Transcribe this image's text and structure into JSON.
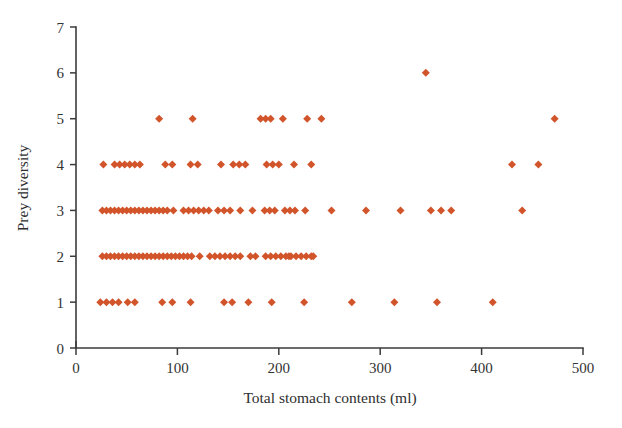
{
  "chart_data": {
    "type": "scatter",
    "title": "",
    "xlabel": "Total stomach contents (ml)",
    "ylabel": "Prey diversity",
    "xlim": [
      0,
      500
    ],
    "ylim": [
      0,
      7
    ],
    "grid": false,
    "legend": null,
    "marker": {
      "shape": "diamond",
      "color": "#D2542A",
      "size_px": 8
    },
    "xticks": [
      0,
      100,
      200,
      300,
      400,
      500
    ],
    "xtick_labels": [
      "0",
      "100",
      "200",
      "300",
      "400",
      "500"
    ],
    "yticks": [
      0,
      1,
      2,
      3,
      4,
      5,
      6,
      7
    ],
    "ytick_labels": [
      "0",
      "1",
      "2",
      "3",
      "4",
      "5",
      "6",
      "7"
    ],
    "axis_color": "#3b3b3b",
    "background": "#ffffff",
    "points": [
      {
        "x": 24,
        "y": 1
      },
      {
        "x": 30,
        "y": 1
      },
      {
        "x": 36,
        "y": 1
      },
      {
        "x": 42,
        "y": 1
      },
      {
        "x": 51,
        "y": 1
      },
      {
        "x": 58,
        "y": 1
      },
      {
        "x": 85,
        "y": 1
      },
      {
        "x": 95,
        "y": 1
      },
      {
        "x": 113,
        "y": 1
      },
      {
        "x": 146,
        "y": 1
      },
      {
        "x": 154,
        "y": 1
      },
      {
        "x": 170,
        "y": 1
      },
      {
        "x": 193,
        "y": 1
      },
      {
        "x": 225,
        "y": 1
      },
      {
        "x": 272,
        "y": 1
      },
      {
        "x": 314,
        "y": 1
      },
      {
        "x": 356,
        "y": 1
      },
      {
        "x": 411,
        "y": 1
      },
      {
        "x": 26,
        "y": 2
      },
      {
        "x": 30,
        "y": 2
      },
      {
        "x": 34,
        "y": 2
      },
      {
        "x": 38,
        "y": 2
      },
      {
        "x": 42,
        "y": 2
      },
      {
        "x": 46,
        "y": 2
      },
      {
        "x": 50,
        "y": 2
      },
      {
        "x": 54,
        "y": 2
      },
      {
        "x": 58,
        "y": 2
      },
      {
        "x": 62,
        "y": 2
      },
      {
        "x": 66,
        "y": 2
      },
      {
        "x": 70,
        "y": 2
      },
      {
        "x": 74,
        "y": 2
      },
      {
        "x": 78,
        "y": 2
      },
      {
        "x": 82,
        "y": 2
      },
      {
        "x": 86,
        "y": 2
      },
      {
        "x": 90,
        "y": 2
      },
      {
        "x": 94,
        "y": 2
      },
      {
        "x": 98,
        "y": 2
      },
      {
        "x": 102,
        "y": 2
      },
      {
        "x": 106,
        "y": 2
      },
      {
        "x": 110,
        "y": 2
      },
      {
        "x": 114,
        "y": 2
      },
      {
        "x": 122,
        "y": 2
      },
      {
        "x": 132,
        "y": 2
      },
      {
        "x": 137,
        "y": 2
      },
      {
        "x": 142,
        "y": 2
      },
      {
        "x": 147,
        "y": 2
      },
      {
        "x": 152,
        "y": 2
      },
      {
        "x": 157,
        "y": 2
      },
      {
        "x": 162,
        "y": 2
      },
      {
        "x": 172,
        "y": 2
      },
      {
        "x": 177,
        "y": 2
      },
      {
        "x": 187,
        "y": 2
      },
      {
        "x": 192,
        "y": 2
      },
      {
        "x": 197,
        "y": 2
      },
      {
        "x": 202,
        "y": 2
      },
      {
        "x": 207,
        "y": 2
      },
      {
        "x": 212,
        "y": 2
      },
      {
        "x": 217,
        "y": 2
      },
      {
        "x": 222,
        "y": 2
      },
      {
        "x": 227,
        "y": 2
      },
      {
        "x": 232,
        "y": 2
      },
      {
        "x": 210,
        "y": 2
      },
      {
        "x": 234,
        "y": 2
      },
      {
        "x": 26,
        "y": 3
      },
      {
        "x": 30,
        "y": 3
      },
      {
        "x": 34,
        "y": 3
      },
      {
        "x": 38,
        "y": 3
      },
      {
        "x": 42,
        "y": 3
      },
      {
        "x": 46,
        "y": 3
      },
      {
        "x": 50,
        "y": 3
      },
      {
        "x": 54,
        "y": 3
      },
      {
        "x": 58,
        "y": 3
      },
      {
        "x": 62,
        "y": 3
      },
      {
        "x": 66,
        "y": 3
      },
      {
        "x": 70,
        "y": 3
      },
      {
        "x": 74,
        "y": 3
      },
      {
        "x": 78,
        "y": 3
      },
      {
        "x": 82,
        "y": 3
      },
      {
        "x": 86,
        "y": 3
      },
      {
        "x": 90,
        "y": 3
      },
      {
        "x": 96,
        "y": 3
      },
      {
        "x": 106,
        "y": 3
      },
      {
        "x": 111,
        "y": 3
      },
      {
        "x": 116,
        "y": 3
      },
      {
        "x": 121,
        "y": 3
      },
      {
        "x": 126,
        "y": 3
      },
      {
        "x": 131,
        "y": 3
      },
      {
        "x": 140,
        "y": 3
      },
      {
        "x": 146,
        "y": 3
      },
      {
        "x": 152,
        "y": 3
      },
      {
        "x": 162,
        "y": 3
      },
      {
        "x": 174,
        "y": 3
      },
      {
        "x": 186,
        "y": 3
      },
      {
        "x": 191,
        "y": 3
      },
      {
        "x": 196,
        "y": 3
      },
      {
        "x": 206,
        "y": 3
      },
      {
        "x": 211,
        "y": 3
      },
      {
        "x": 216,
        "y": 3
      },
      {
        "x": 226,
        "y": 3
      },
      {
        "x": 252,
        "y": 3
      },
      {
        "x": 286,
        "y": 3
      },
      {
        "x": 320,
        "y": 3
      },
      {
        "x": 350,
        "y": 3
      },
      {
        "x": 360,
        "y": 3
      },
      {
        "x": 370,
        "y": 3
      },
      {
        "x": 440,
        "y": 3
      },
      {
        "x": 27,
        "y": 4
      },
      {
        "x": 38,
        "y": 4
      },
      {
        "x": 43,
        "y": 4
      },
      {
        "x": 48,
        "y": 4
      },
      {
        "x": 53,
        "y": 4
      },
      {
        "x": 58,
        "y": 4
      },
      {
        "x": 63,
        "y": 4
      },
      {
        "x": 88,
        "y": 4
      },
      {
        "x": 95,
        "y": 4
      },
      {
        "x": 113,
        "y": 4
      },
      {
        "x": 120,
        "y": 4
      },
      {
        "x": 143,
        "y": 4
      },
      {
        "x": 155,
        "y": 4
      },
      {
        "x": 161,
        "y": 4
      },
      {
        "x": 167,
        "y": 4
      },
      {
        "x": 188,
        "y": 4
      },
      {
        "x": 194,
        "y": 4
      },
      {
        "x": 200,
        "y": 4
      },
      {
        "x": 215,
        "y": 4
      },
      {
        "x": 232,
        "y": 4
      },
      {
        "x": 430,
        "y": 4
      },
      {
        "x": 456,
        "y": 4
      },
      {
        "x": 82,
        "y": 5
      },
      {
        "x": 115,
        "y": 5
      },
      {
        "x": 182,
        "y": 5
      },
      {
        "x": 187,
        "y": 5
      },
      {
        "x": 192,
        "y": 5
      },
      {
        "x": 204,
        "y": 5
      },
      {
        "x": 228,
        "y": 5
      },
      {
        "x": 242,
        "y": 5
      },
      {
        "x": 472,
        "y": 5
      },
      {
        "x": 345,
        "y": 6
      }
    ]
  }
}
